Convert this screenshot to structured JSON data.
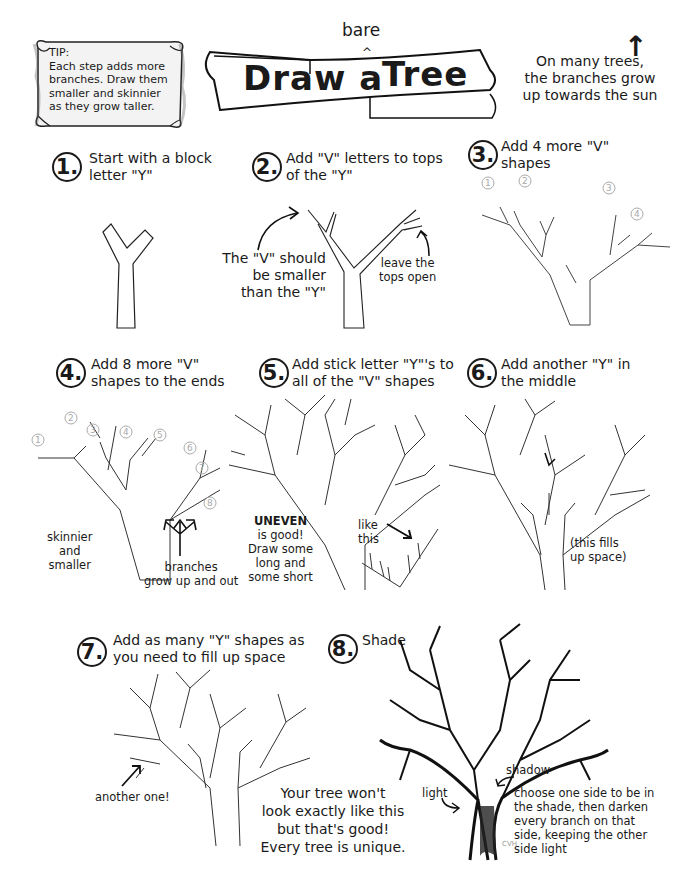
{
  "tip": {
    "heading": "TIP:",
    "lines": [
      "Each step adds more",
      "branches. Draw them",
      "smaller and skinnier",
      "as they grow taller."
    ]
  },
  "title": {
    "main_left": "Draw a",
    "main_right": "Tree",
    "insert": "bare",
    "caret": "^"
  },
  "sun_note": {
    "lines": [
      "On many trees,",
      "the branches grow",
      "up towards the sun"
    ],
    "arrow": "↑"
  },
  "steps": [
    {
      "number": "1.",
      "lines": [
        "Start with a block",
        "letter \"Y\""
      ]
    },
    {
      "number": "2.",
      "lines": [
        "Add \"V\" letters to tops",
        "of the \"Y\""
      ],
      "notes": {
        "v_smaller": [
          "The \"V\" should",
          "be smaller",
          "than the \"Y\""
        ],
        "tops_open": [
          "leave the",
          "tops open"
        ]
      }
    },
    {
      "number": "3.",
      "lines": [
        "Add 4 more \"V\"",
        "shapes"
      ],
      "markers": [
        "1",
        "2",
        "3",
        "4"
      ]
    },
    {
      "number": "4.",
      "lines": [
        "Add 8 more \"V\"",
        "shapes to the ends"
      ],
      "markers": [
        "1",
        "2",
        "3",
        "4",
        "5",
        "6",
        "7",
        "8"
      ],
      "notes": {
        "skinnier": [
          "skinnier",
          "and",
          "smaller"
        ],
        "grow": [
          "branches",
          "grow up and out"
        ]
      }
    },
    {
      "number": "5.",
      "lines": [
        "Add stick letter \"Y\"'s to",
        "all of the \"V\" shapes"
      ],
      "notes": {
        "uneven": [
          "UNEVEN",
          "is good!",
          "Draw some",
          "long and",
          "some short"
        ],
        "like_this": [
          "like",
          "this"
        ]
      }
    },
    {
      "number": "6.",
      "lines": [
        "Add another \"Y\" in",
        "the middle"
      ],
      "notes": {
        "fills": [
          "(this fills",
          "up space)"
        ]
      }
    },
    {
      "number": "7.",
      "lines": [
        "Add as many \"Y\" shapes as",
        "you need to fill up space"
      ],
      "notes": {
        "another": "another one!"
      }
    },
    {
      "number": "8.",
      "lines": [
        "Shade"
      ],
      "notes": {
        "light": "light",
        "shadow": "shadow",
        "signature": "CVH",
        "choose": [
          "choose one side to be in",
          "the shade, then darken",
          "every branch on that",
          "side, keeping the other",
          "side light"
        ]
      }
    }
  ],
  "closing": {
    "lines": [
      "Your tree won't",
      "look exactly like this",
      "but that's good!",
      "Every tree is unique."
    ]
  }
}
